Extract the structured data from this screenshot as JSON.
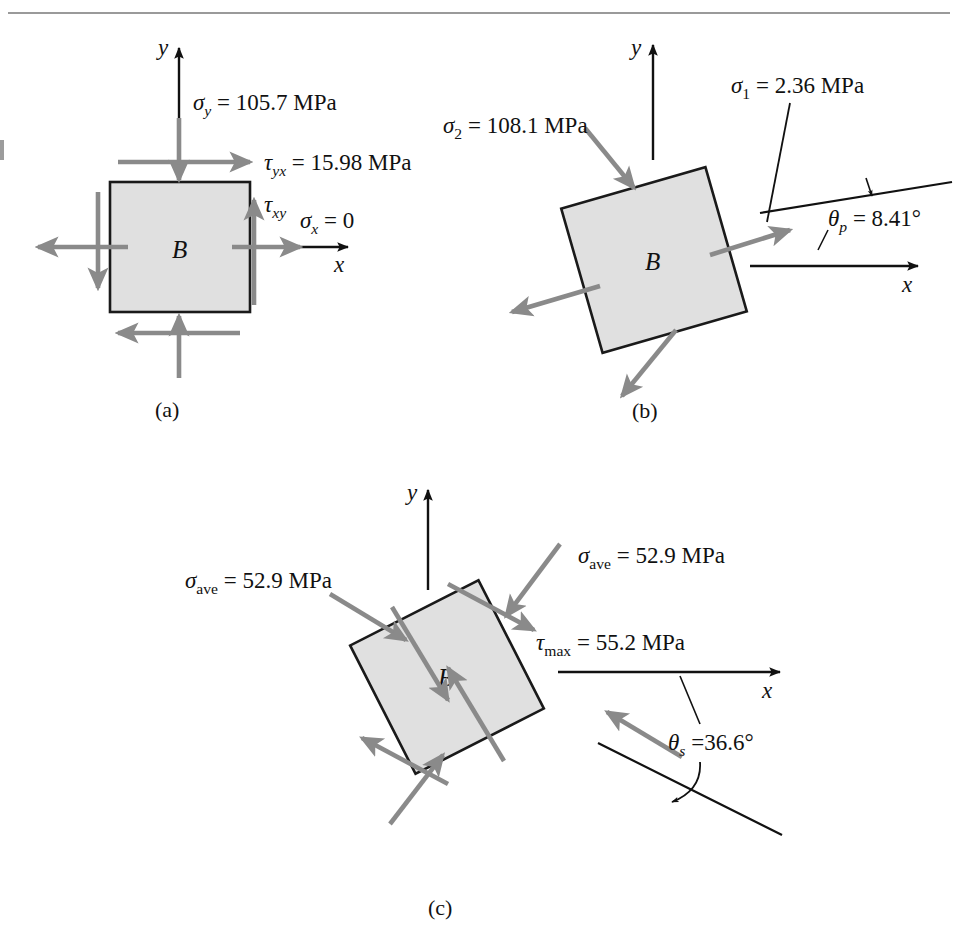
{
  "figure": {
    "type": "stress-element-diagram",
    "page_rule": {
      "present": true,
      "y": 13
    },
    "colors": {
      "stress_arrow": "#8a8a8a",
      "outline": "#1a1a1a",
      "element_fill": "#e0e0e0",
      "axis": "#111111",
      "text": "#111111",
      "background": "#ffffff"
    },
    "panels": [
      {
        "id": "a",
        "caption": "(a)",
        "body_label": "B",
        "element_rotation_deg": 0,
        "axes": {
          "x_label": "x",
          "y_label": "y"
        },
        "labels": [
          {
            "name": "sigma-y",
            "symbol": "σ",
            "subscript": "y",
            "value": "105.7",
            "unit": "MPa",
            "text": "σy = 105.7 MPa"
          },
          {
            "name": "tau-yx",
            "symbol": "τ",
            "subscript": "yx",
            "value": "15.98",
            "unit": "MPa",
            "text": "τyx = 15.98 MPa"
          },
          {
            "name": "tau-xy",
            "symbol": "τ",
            "subscript": "xy",
            "value": "",
            "unit": "",
            "text": "τxy"
          },
          {
            "name": "sigma-x",
            "symbol": "σ",
            "subscript": "x",
            "value": "0",
            "unit": "",
            "text": "σx = 0"
          }
        ]
      },
      {
        "id": "b",
        "caption": "(b)",
        "body_label": "B",
        "element_rotation_deg": -16,
        "axes": {
          "x_label": "x",
          "y_label": "y"
        },
        "labels": [
          {
            "name": "sigma-2",
            "symbol": "σ",
            "subscript": "2",
            "value": "108.1",
            "unit": "MPa",
            "text": "σ2 = 108.1 MPa"
          },
          {
            "name": "sigma-1",
            "symbol": "σ",
            "subscript": "1",
            "value": "2.36",
            "unit": "MPa",
            "text": "σ1 = 2.36 MPa"
          },
          {
            "name": "theta-p",
            "symbol": "θ",
            "subscript": "p",
            "value": "8.41",
            "unit": "°",
            "text": "θp = 8.41°"
          }
        ]
      },
      {
        "id": "c",
        "caption": "(c)",
        "body_label": "B",
        "element_rotation_deg": -27,
        "axes": {
          "x_label": "x",
          "y_label": "y"
        },
        "labels": [
          {
            "name": "sigma-ave-left",
            "symbol": "σ",
            "subscript": "ave",
            "value": "52.9",
            "unit": "MPa",
            "text": "σave = 52.9 MPa"
          },
          {
            "name": "sigma-ave-right",
            "symbol": "σ",
            "subscript": "ave",
            "value": "52.9",
            "unit": "MPa",
            "text": "σave = 52.9 MPa"
          },
          {
            "name": "tau-max",
            "symbol": "τ",
            "subscript": "max",
            "value": "55.2",
            "unit": "MPa",
            "text": "τmax = 55.2 MPa"
          },
          {
            "name": "theta-s",
            "symbol": "θ",
            "subscript": "s",
            "value": "36.6",
            "unit": "°",
            "text": "θs =36.6°"
          }
        ]
      }
    ],
    "text": {
      "sigma": "σ",
      "tau": "τ",
      "theta": "θ",
      "degree": "°",
      "equals": " = ",
      "equals_tight": " =",
      "unit_mpa": "MPa",
      "body": "B",
      "axis_x": "x",
      "axis_y": "y",
      "sub_y": "y",
      "sub_x": "x",
      "sub_yx": "yx",
      "sub_xy": "xy",
      "sub_1": "1",
      "sub_2": "2",
      "sub_p": "p",
      "sub_s": "s",
      "sub_ave": "ave",
      "sub_max": "max",
      "val_1057": "105.7",
      "val_1598": "15.98",
      "val_0": "0",
      "val_1081": "108.1",
      "val_236": "2.36",
      "val_841": "8.41",
      "val_529": "52.9",
      "val_552": "55.2",
      "val_366": "36.6",
      "caption_a": "(a)",
      "caption_b": "(b)",
      "caption_c": "(c)"
    }
  }
}
